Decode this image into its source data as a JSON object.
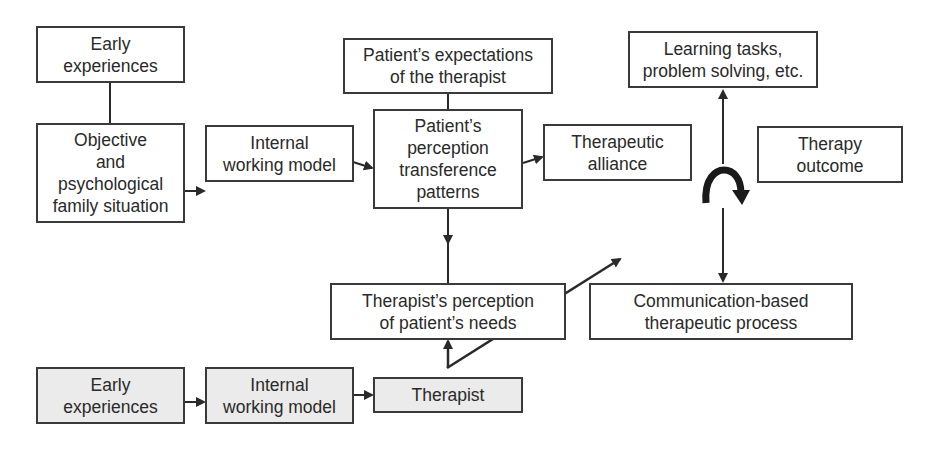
{
  "diagram": {
    "nodes": {
      "early_experiences_patient": "Early\nexperiences",
      "family_situation": "Objective\nand\npsychological\nfamily situation",
      "internal_working_model_patient": "Internal\nworking model",
      "patient_expectations": "Patient’s expectations\nof the therapist",
      "patient_perception": "Patient’s\nperception\ntransference\npatterns",
      "therapeutic_alliance": "Therapeutic\nalliance",
      "learning_tasks": "Learning tasks,\nproblem solving, etc.",
      "therapy_outcome": "Therapy\noutcome",
      "therapist_perception": "Therapist’s perception\nof patient’s needs",
      "communication_process": "Communication-based\ntherapeutic process",
      "early_experiences_therapist": "Early\nexperiences",
      "internal_working_model_therapist": "Internal\nworking model",
      "therapist": "Therapist"
    },
    "edges": [
      {
        "from": "early_experiences_patient",
        "to": "family_situation",
        "type": "line"
      },
      {
        "from": "family_situation",
        "to": "internal_working_model_patient",
        "type": "arrow"
      },
      {
        "from": "internal_working_model_patient",
        "to": "patient_perception",
        "type": "arrow"
      },
      {
        "from": "patient_expectations",
        "to": "patient_perception",
        "type": "line"
      },
      {
        "from": "patient_perception",
        "to": "therapeutic_alliance",
        "type": "arrow"
      },
      {
        "from": "patient_perception",
        "to": "therapist_perception",
        "type": "arrow"
      },
      {
        "from": "therapist",
        "to": "therapist_perception",
        "type": "arrow"
      },
      {
        "from": "therapist",
        "to": "communication_process",
        "type": "diagonal-arrow"
      },
      {
        "from": "communication_process",
        "to": "learning_tasks",
        "type": "arrow"
      },
      {
        "from": "early_experiences_therapist",
        "to": "internal_working_model_therapist",
        "type": "arrow"
      },
      {
        "from": "internal_working_model_therapist",
        "to": "therapist",
        "type": "arrow"
      }
    ],
    "icons": {
      "cycle": "curved-arrow-icon"
    },
    "colors": {
      "line": "#2a2a2a",
      "shaded_fill": "#ebebeb"
    }
  }
}
